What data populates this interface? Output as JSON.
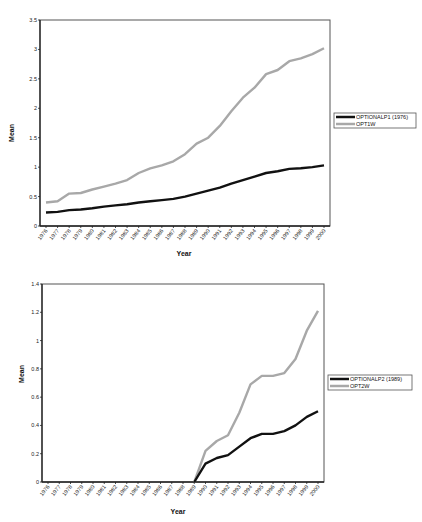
{
  "chart_data": [
    {
      "type": "line",
      "title": "",
      "xlabel": "Year",
      "ylabel": "Mean",
      "ylim": [
        0,
        3.5
      ],
      "yticks": [
        "0",
        "0.5",
        "1",
        "1.5",
        "2",
        "2.5",
        "3",
        "3.5"
      ],
      "grid": false,
      "legend_position": "right",
      "x": [
        "1976",
        "1977",
        "1978",
        "1979",
        "1980",
        "1981",
        "1982",
        "1983",
        "1984",
        "1985",
        "1986",
        "1987",
        "1988",
        "1989",
        "1990",
        "1991",
        "1992",
        "1993",
        "1994",
        "1995",
        "1996",
        "1997",
        "1998",
        "1999",
        "2000"
      ],
      "series": [
        {
          "name": "OPTIONALP1 (1976)",
          "color": "#111111",
          "values": [
            0.23,
            0.24,
            0.27,
            0.28,
            0.3,
            0.33,
            0.35,
            0.37,
            0.4,
            0.42,
            0.44,
            0.46,
            0.5,
            0.55,
            0.6,
            0.65,
            0.72,
            0.78,
            0.84,
            0.9,
            0.93,
            0.97,
            0.98,
            1.0,
            1.03
          ]
        },
        {
          "name": "OPT1W",
          "color": "#a8a8a8",
          "values": [
            0.4,
            0.42,
            0.55,
            0.56,
            0.62,
            0.67,
            0.72,
            0.78,
            0.9,
            0.98,
            1.03,
            1.1,
            1.22,
            1.4,
            1.5,
            1.7,
            1.95,
            2.18,
            2.35,
            2.58,
            2.65,
            2.8,
            2.85,
            2.92,
            3.02
          ]
        }
      ]
    },
    {
      "type": "line",
      "title": "",
      "xlabel": "Year",
      "ylabel": "Mean",
      "ylim": [
        0,
        1.4
      ],
      "yticks": [
        "0",
        "0.2",
        "0.4",
        "0.6",
        "0.8",
        "1",
        "1.2",
        "1.4"
      ],
      "grid": false,
      "legend_position": "right",
      "x": [
        "1976",
        "1977",
        "1978",
        "1979",
        "1980",
        "1981",
        "1982",
        "1983",
        "1984",
        "1985",
        "1986",
        "1987",
        "1988",
        "1989",
        "1990",
        "1991",
        "1992",
        "1993",
        "1994",
        "1995",
        "1996",
        "1997",
        "1998",
        "1999",
        "2000"
      ],
      "series": [
        {
          "name": "OPTIONALP2 (1989)",
          "color": "#111111",
          "values": [
            null,
            null,
            null,
            null,
            null,
            null,
            null,
            null,
            null,
            null,
            null,
            null,
            null,
            0,
            0.13,
            0.17,
            0.19,
            0.25,
            0.31,
            0.34,
            0.34,
            0.36,
            0.4,
            0.46,
            0.5
          ]
        },
        {
          "name": "OPT2W",
          "color": "#a8a8a8",
          "values": [
            null,
            null,
            null,
            null,
            null,
            null,
            null,
            null,
            null,
            null,
            null,
            null,
            null,
            0,
            0.22,
            0.29,
            0.33,
            0.49,
            0.69,
            0.75,
            0.75,
            0.77,
            0.87,
            1.07,
            1.21
          ]
        }
      ]
    }
  ],
  "charts": [
    {
      "xlabel": "Year",
      "ylabel": "Mean",
      "legend": [
        "OPTIONALP1 (1976)",
        "OPT1W"
      ]
    },
    {
      "xlabel": "Year",
      "ylabel": "Mean",
      "legend": [
        "OPTIONALP2 (1989)",
        "OPT2W"
      ]
    }
  ]
}
